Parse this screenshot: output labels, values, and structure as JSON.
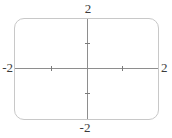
{
  "figure": {
    "labels": {
      "top": "2",
      "bottom": "-2",
      "left": "-2",
      "right": "2"
    }
  },
  "chart_data": {
    "type": "line",
    "series": [],
    "title": "",
    "xlabel": "",
    "ylabel": "",
    "xlim": [
      -2,
      2
    ],
    "ylim": [
      -2,
      2
    ],
    "x_tick_values": [
      -1,
      1
    ],
    "y_tick_values": [
      -1,
      1
    ],
    "edge_labels": {
      "top": "2",
      "bottom": "-2",
      "left": "-2",
      "right": "2"
    },
    "grid": false,
    "legend": false,
    "frame": "rounded-rectangle"
  },
  "colors": {
    "background": "#ffffff",
    "frame": "#c8c8c8",
    "axis": "#8e8e8e",
    "tick": "#7a7a7a",
    "text": "#3b3b3b"
  }
}
